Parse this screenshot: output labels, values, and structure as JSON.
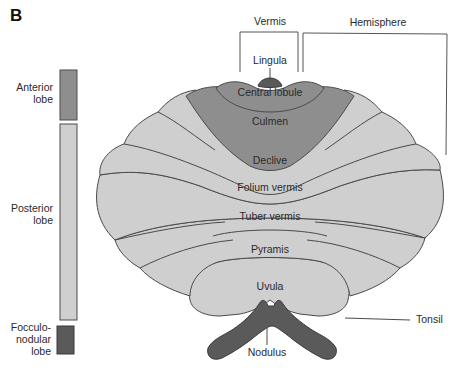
{
  "figure": {
    "panel_label": "B"
  },
  "colors": {
    "anterior": "#8e8e8e",
    "posterior": "#cfcfcf",
    "flocculonodular": "#5a5a5a",
    "outline": "#4a4a4a"
  },
  "legend": {
    "items": [
      {
        "label_line1": "Anterior",
        "label_line2": "lobe",
        "color": "#8e8e8e"
      },
      {
        "label_line1": "Posterior",
        "label_line2": "lobe",
        "color": "#cfcfcf"
      },
      {
        "label_line1": "Focculo-",
        "label_line2": "nodular",
        "label_line3": "lobe",
        "color": "#5a5a5a"
      }
    ]
  },
  "brackets": {
    "vermis": "Vermis",
    "hemisphere": "Hemisphere"
  },
  "lobules": {
    "lingula": "Lingula",
    "central_lobule": "Central lobule",
    "culmen": "Culmen",
    "declive": "Declive",
    "folium_vermis": "Folium vermis",
    "tuber_vermis": "Tuber vermis",
    "pyramis": "Pyramis",
    "uvula": "Uvula",
    "tonsil": "Tonsil",
    "nodulus": "Nodulus"
  }
}
